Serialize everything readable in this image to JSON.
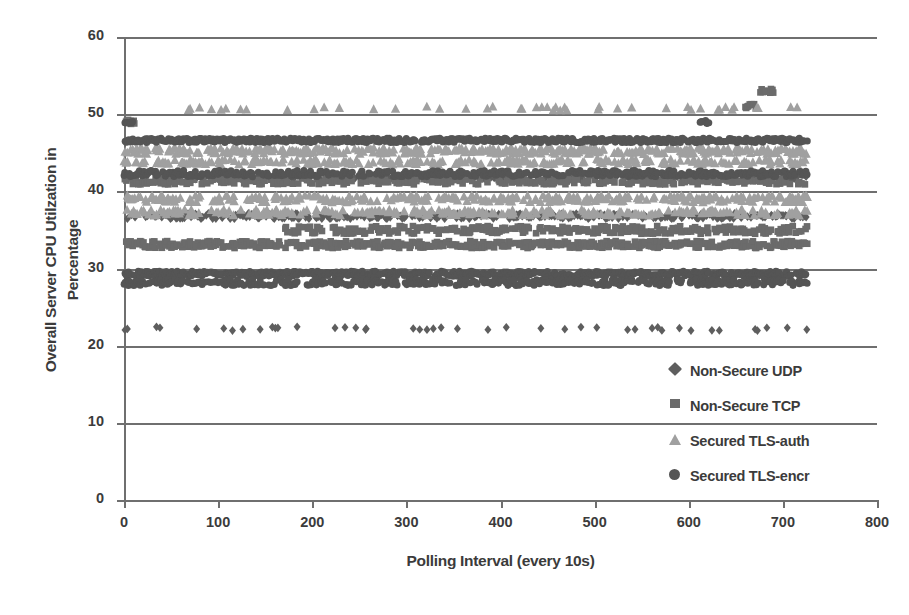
{
  "chart_data": {
    "type": "scatter",
    "title": "",
    "xlabel": "Polling Interval (every 10s)",
    "ylabel_line1": "Overall Server CPU Utilzation in",
    "ylabel_line2": "Percentage",
    "xlim": [
      0,
      800
    ],
    "ylim": [
      0,
      60
    ],
    "xticks": [
      0,
      100,
      200,
      300,
      400,
      500,
      600,
      700,
      800
    ],
    "yticks": [
      0,
      10,
      20,
      30,
      40,
      50,
      60
    ],
    "grid": true,
    "grid_axis": "y",
    "legend_position": "inside-lower-right",
    "x_range_of_data": [
      0,
      726
    ],
    "series": [
      {
        "name": "Non-Secure UDP",
        "marker": "diamond",
        "color": "#5e5e5e",
        "bands": [
          {
            "y": 22.2,
            "x_from": 0,
            "x_to": 726,
            "density": 0.06,
            "jitter": 0.25
          },
          {
            "y": 36.8,
            "x_from": 0,
            "x_to": 726,
            "density": 0.55,
            "jitter": 0.35
          },
          {
            "y": 41.8,
            "x_from": 0,
            "x_to": 726,
            "density": 0.22,
            "jitter": 0.3
          }
        ]
      },
      {
        "name": "Non-Secure TCP",
        "marker": "square",
        "color": "#6b6b6b",
        "bands": [
          {
            "y": 33.1,
            "x_from": 0,
            "x_to": 726,
            "density": 0.7,
            "jitter": 0.45
          },
          {
            "y": 35.0,
            "x_from": 170,
            "x_to": 726,
            "density": 0.55,
            "jitter": 0.5
          },
          {
            "y": 41.3,
            "x_from": 0,
            "x_to": 726,
            "density": 0.45,
            "jitter": 0.4
          },
          {
            "y": 49.0,
            "x_from": 2,
            "x_to": 12,
            "density": 0.9,
            "jitter": 0.3
          },
          {
            "y": 53.0,
            "x_from": 676,
            "x_to": 690,
            "density": 0.9,
            "jitter": 0.3
          },
          {
            "y": 51.0,
            "x_from": 660,
            "x_to": 672,
            "density": 0.8,
            "jitter": 0.3
          }
        ]
      },
      {
        "name": "Secured TLS-auth",
        "marker": "triangle",
        "color": "#a0a0a0",
        "bands": [
          {
            "y": 50.7,
            "x_from": 55,
            "x_to": 726,
            "density": 0.07,
            "jitter": 0.25
          },
          {
            "y": 45.2,
            "x_from": 0,
            "x_to": 726,
            "density": 0.5,
            "jitter": 0.4
          },
          {
            "y": 43.8,
            "x_from": 0,
            "x_to": 726,
            "density": 0.35,
            "jitter": 0.35
          },
          {
            "y": 39.0,
            "x_from": 0,
            "x_to": 726,
            "density": 0.4,
            "jitter": 0.45
          },
          {
            "y": 37.2,
            "x_from": 0,
            "x_to": 726,
            "density": 0.35,
            "jitter": 0.4
          }
        ]
      },
      {
        "name": "Secured TLS-encr",
        "marker": "circle",
        "color": "#555555",
        "bands": [
          {
            "y": 46.6,
            "x_from": 0,
            "x_to": 726,
            "density": 0.85,
            "jitter": 0.28
          },
          {
            "y": 42.3,
            "x_from": 0,
            "x_to": 726,
            "density": 0.6,
            "jitter": 0.4
          },
          {
            "y": 29.3,
            "x_from": 0,
            "x_to": 726,
            "density": 0.75,
            "jitter": 0.35
          },
          {
            "y": 28.2,
            "x_from": 0,
            "x_to": 726,
            "density": 0.6,
            "jitter": 0.4
          },
          {
            "y": 49.0,
            "x_from": 0,
            "x_to": 10,
            "density": 0.9,
            "jitter": 0.2
          },
          {
            "y": 49.0,
            "x_from": 612,
            "x_to": 622,
            "density": 0.9,
            "jitter": 0.2
          }
        ]
      }
    ]
  },
  "legend": {
    "items": [
      {
        "label": "Non-Secure UDP",
        "marker": "diamond",
        "color": "#5e5e5e"
      },
      {
        "label": "Non-Secure TCP",
        "marker": "square",
        "color": "#6b6b6b"
      },
      {
        "label": "Secured TLS-auth",
        "marker": "triangle",
        "color": "#a0a0a0"
      },
      {
        "label": "Secured TLS-encr",
        "marker": "circle",
        "color": "#555555"
      }
    ]
  },
  "axes": {
    "y_tick_labels": [
      "60",
      "50",
      "40",
      "30",
      "20",
      "10",
      "0"
    ],
    "x_tick_labels": [
      "0",
      "100",
      "200",
      "300",
      "400",
      "500",
      "600",
      "700",
      "800"
    ]
  },
  "colors": {
    "axis": "#6f6f6f",
    "text": "#3b3b3b",
    "background": "#ffffff"
  }
}
